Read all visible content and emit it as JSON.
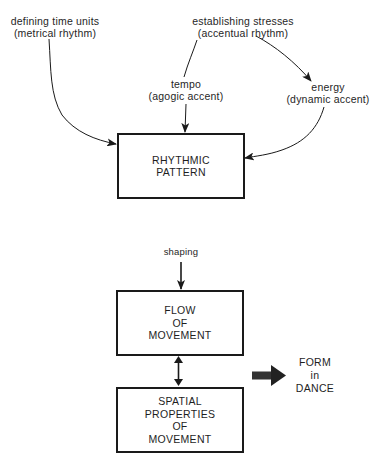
{
  "diagram": {
    "inputs": {
      "metrical": {
        "line1": "defining time units",
        "line2": "(metrical rhythm)"
      },
      "accentual": {
        "line1": "establishing stresses",
        "line2": "(accentual rhythm)"
      },
      "tempo": {
        "line1": "tempo",
        "line2": "(agogic accent)"
      },
      "energy": {
        "line1": "energy",
        "line2": "(dynamic accent)"
      }
    },
    "boxes": {
      "rhythmic_pattern": {
        "lines": [
          "RHYTHMIC",
          "PATTERN"
        ]
      },
      "flow_of_movement": {
        "lines": [
          "FLOW",
          "OF",
          "MOVEMENT"
        ]
      },
      "spatial_properties": {
        "lines": [
          "SPATIAL",
          "PROPERTIES",
          "OF",
          "MOVEMENT"
        ]
      }
    },
    "shaping_label": "shaping",
    "output": {
      "lines": [
        "FORM",
        "in",
        "DANCE"
      ]
    },
    "edges": [
      {
        "from": "defining time units (metrical rhythm)",
        "to": "RHYTHMIC PATTERN",
        "type": "curved-arrow"
      },
      {
        "from": "establishing stresses (accentual rhythm)",
        "to": "tempo (agogic accent)",
        "type": "line"
      },
      {
        "from": "establishing stresses (accentual rhythm)",
        "to": "energy (dynamic accent)",
        "type": "curved-arrow"
      },
      {
        "from": "tempo (agogic accent)",
        "to": "RHYTHMIC PATTERN",
        "type": "arrow"
      },
      {
        "from": "energy (dynamic accent)",
        "to": "RHYTHMIC PATTERN",
        "type": "curved-arrow"
      },
      {
        "from": "shaping",
        "to": "FLOW OF MOVEMENT",
        "type": "arrow"
      },
      {
        "from": "FLOW OF MOVEMENT",
        "to": "SPATIAL PROPERTIES OF MOVEMENT",
        "type": "double-arrow"
      },
      {
        "from": "FLOW/SPATIAL",
        "to": "FORM in DANCE",
        "type": "bold-arrow"
      }
    ],
    "colors": {
      "ink": "#1a1a1a",
      "background": "#ffffff"
    }
  }
}
